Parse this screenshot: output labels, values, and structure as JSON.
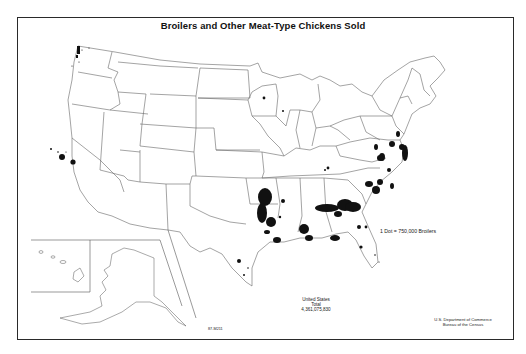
{
  "map": {
    "title": "Broilers and Other Meat-Type Chickens Sold",
    "legend": {
      "dot_value_label": "1 Dot = 750,000 Broilers"
    },
    "total": {
      "line1": "United States",
      "line2": "Total",
      "value": "4,361,075,830"
    },
    "credit": {
      "line1": "U.S. Department of Commerce",
      "line2": "Bureau of the Census"
    },
    "map_code": "87-M211",
    "insets": [
      "Alaska",
      "Hawaii"
    ],
    "colors": {
      "background": "#ffffff",
      "outline": "#555555",
      "dots": "#111111",
      "frame": "#2a2a2a"
    },
    "dense_regions": [
      "Delmarva Peninsula",
      "Northwest Arkansas",
      "North Georgia",
      "Northern Alabama",
      "Shenandoah Valley, Virginia",
      "North Carolina",
      "Central Mississippi",
      "East Texas",
      "Central California",
      "Western Washington"
    ]
  }
}
